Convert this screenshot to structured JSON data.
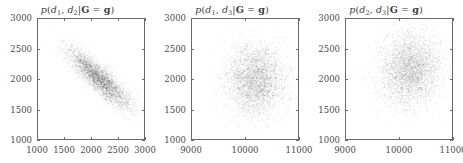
{
  "figure": {
    "kind": "three-panel-2d-density-scatter",
    "background_color": "#ffffff",
    "axis_color": "#6b6b6b",
    "point_color": "#1a1a1a"
  },
  "chart_data": [
    {
      "type": "scatter",
      "title": "p(d1, d2|G = g)",
      "title_parts": {
        "p": "p",
        "open": "(",
        "var1": "d",
        "var1_sub": "1",
        "comma": ", ",
        "var2": "d",
        "var2_sub": "2",
        "bar": "|",
        "cond_lhs": "G",
        "eq": " = ",
        "cond_rhs": "g",
        "close": ")"
      },
      "xlabel": "",
      "ylabel": "",
      "xlim": [
        1000,
        3000
      ],
      "ylim": [
        1000,
        3000
      ],
      "xticks": [
        1000,
        1500,
        2000,
        2500,
        3000
      ],
      "xtick_labels": [
        "1000",
        "1500",
        "2000",
        "2500",
        "3000"
      ],
      "yticks": [
        1000,
        1500,
        2000,
        2500,
        3000
      ],
      "ytick_labels": [
        "1000",
        "1500",
        "2000",
        "2500",
        "3000"
      ],
      "grid": false,
      "legend": null,
      "distribution": {
        "shape": "elongated-negative-correlation",
        "mean_x": 2150,
        "mean_y": 2010,
        "sigma_x": 300,
        "sigma_y": 250,
        "correlation": -0.87,
        "n_points": 4200
      }
    },
    {
      "type": "scatter",
      "title": "p(d1, d3|G = g)",
      "title_parts": {
        "p": "p",
        "open": "(",
        "var1": "d",
        "var1_sub": "1",
        "comma": ", ",
        "var2": "d",
        "var2_sub": "3",
        "bar": "|",
        "cond_lhs": "G",
        "eq": " = ",
        "cond_rhs": "g",
        "close": ")"
      },
      "xlabel": "",
      "ylabel": "",
      "xlim": [
        9000,
        11000
      ],
      "ylim": [
        1000,
        3000
      ],
      "xticks": [
        9000,
        10000,
        11000
      ],
      "xtick_labels": [
        "9000",
        "10000",
        "11000"
      ],
      "yticks": [
        1000,
        1500,
        2000,
        2500,
        3000
      ],
      "ytick_labels": [
        "1000",
        "1500",
        "2000",
        "2500",
        "3000"
      ],
      "grid": false,
      "legend": null,
      "distribution": {
        "shape": "round-isotropic",
        "mean_x": 10180,
        "mean_y": 1990,
        "sigma_x": 290,
        "sigma_y": 300,
        "correlation": 0.0,
        "n_points": 4200
      }
    },
    {
      "type": "scatter",
      "title": "p(d2, d3|G = g)",
      "title_parts": {
        "p": "p",
        "open": "(",
        "var1": "d",
        "var1_sub": "2",
        "comma": ", ",
        "var2": "d",
        "var2_sub": "3",
        "bar": "|",
        "cond_lhs": "G",
        "eq": " = ",
        "cond_rhs": "g",
        "close": ")"
      },
      "xlabel": "",
      "ylabel": "",
      "xlim": [
        9000,
        11000
      ],
      "ylim": [
        1000,
        3000
      ],
      "xticks": [
        9000,
        10000,
        11000
      ],
      "xtick_labels": [
        "9000",
        "10000",
        "11000"
      ],
      "yticks": [
        1000,
        1500,
        2000,
        2500,
        3000
      ],
      "ytick_labels": [
        "1000",
        "1500",
        "2000",
        "2500",
        "3000"
      ],
      "grid": false,
      "legend": null,
      "distribution": {
        "shape": "round-isotropic",
        "mean_x": 10200,
        "mean_y": 2160,
        "sigma_x": 290,
        "sigma_y": 310,
        "correlation": 0.05,
        "n_points": 4200
      }
    }
  ]
}
